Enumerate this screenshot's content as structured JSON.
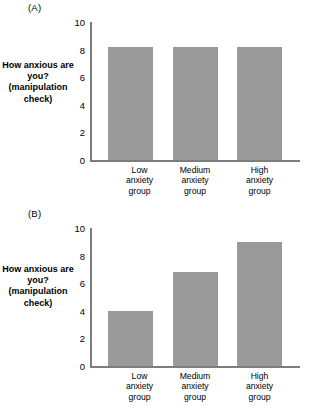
{
  "figure": {
    "panels": [
      {
        "panel_label": "(A)",
        "ylabel": "How anxious\nare you?\n(manipulation\ncheck)"
      },
      {
        "panel_label": "(B)",
        "ylabel": "How anxious\nare you?\n(manipulation\ncheck)"
      }
    ],
    "tick_labels": [
      "10",
      "8",
      "6",
      "4",
      "2",
      "0"
    ],
    "category_labels": [
      "Low\nanxiety\ngroup",
      "Medium\nanxiety\ngroup",
      "High\nanxiety\ngroup"
    ],
    "colors": {
      "bar_fill": "#9a9a9a",
      "axis_line": "#7d7d7d",
      "text": "#000000",
      "background": "#ffffff"
    }
  },
  "chart_data": [
    {
      "type": "bar",
      "title": "(A)",
      "categories": [
        "Low anxiety group",
        "Medium anxiety group",
        "High anxiety group"
      ],
      "values": [
        8.2,
        8.2,
        8.2
      ],
      "xlabel": "",
      "ylabel": "How anxious are you? (manipulation check)",
      "ylim": [
        0,
        10
      ],
      "yticks": [
        0,
        2,
        4,
        6,
        8,
        10
      ],
      "grid": false,
      "legend": "none"
    },
    {
      "type": "bar",
      "title": "(B)",
      "categories": [
        "Low anxiety group",
        "Medium anxiety group",
        "High anxiety group"
      ],
      "values": [
        4.0,
        6.8,
        9.0
      ],
      "xlabel": "",
      "ylabel": "How anxious are you? (manipulation check)",
      "ylim": [
        0,
        10
      ],
      "yticks": [
        0,
        2,
        4,
        6,
        8,
        10
      ],
      "grid": false,
      "legend": "none"
    }
  ]
}
